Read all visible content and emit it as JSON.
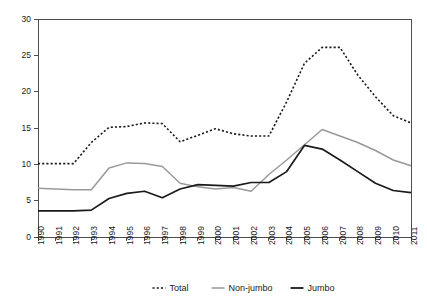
{
  "chart_data": {
    "type": "line",
    "title": "",
    "subtitle": "",
    "xlabel": "",
    "ylabel": "",
    "grid": false,
    "legend_position": "bottom",
    "xlim": [
      1990,
      2011
    ],
    "ylim": [
      0,
      30
    ],
    "ytick_values": [
      0,
      5,
      10,
      15,
      20,
      25,
      30
    ],
    "ytick_labels": [
      "0",
      "5",
      "10",
      "15",
      "20",
      "25",
      "30"
    ],
    "categories": [
      1990,
      1991,
      1992,
      1993,
      1994,
      1995,
      1996,
      1997,
      1998,
      1999,
      2000,
      2001,
      2002,
      2003,
      2004,
      2005,
      2006,
      2007,
      2008,
      2009,
      2010,
      2011
    ],
    "xtick_labels": [
      "1990",
      "1991",
      "1992",
      "1993",
      "1994",
      "1995",
      "1996",
      "1997",
      "1998",
      "1999",
      "2000",
      "2001",
      "2002",
      "2003",
      "2004",
      "2005",
      "2006",
      "2007",
      "2008",
      "2009",
      "2010",
      "2011"
    ],
    "series": [
      {
        "name": "Total",
        "style": "dotted",
        "color": "#1a1a1a",
        "values": [
          10.1,
          10.1,
          10.1,
          13.0,
          15.1,
          15.2,
          15.7,
          15.6,
          13.1,
          14.0,
          14.9,
          14.2,
          13.9,
          13.9,
          18.6,
          23.9,
          26.1,
          26.1,
          22.3,
          19.3,
          16.7,
          15.7
        ]
      },
      {
        "name": "Non-jumbo",
        "style": "solid",
        "color": "#999999",
        "values": [
          6.7,
          6.6,
          6.5,
          6.5,
          9.5,
          10.2,
          10.1,
          9.7,
          7.4,
          6.9,
          6.6,
          6.8,
          6.3,
          8.6,
          10.6,
          12.7,
          14.8,
          13.9,
          13.0,
          11.9,
          10.6,
          9.8
        ]
      },
      {
        "name": "Jumbo",
        "style": "solid",
        "color": "#1a1a1a",
        "values": [
          3.6,
          3.6,
          3.6,
          3.7,
          5.3,
          6.0,
          6.3,
          5.4,
          6.6,
          7.2,
          7.1,
          7.0,
          7.5,
          7.5,
          9.0,
          12.6,
          12.1,
          10.6,
          9.0,
          7.4,
          6.4,
          6.1
        ]
      }
    ],
    "legend": [
      {
        "label": "Total",
        "style": "dotted",
        "color": "#1a1a1a"
      },
      {
        "label": "Non-jumbo",
        "style": "solid",
        "color": "#999999"
      },
      {
        "label": "Jumbo",
        "style": "solid",
        "color": "#1a1a1a"
      }
    ]
  }
}
